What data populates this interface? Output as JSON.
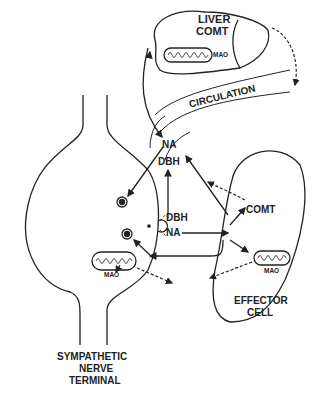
{
  "diagram": {
    "type": "pharmacology-schematic",
    "labels": {
      "liver": "LIVER",
      "liver_comt": "COMT",
      "liver_mao": "MAO",
      "circulation": "CIRCULATION",
      "na_top": "NA",
      "dbh_top": "DBH",
      "dbh_mid": "DBH",
      "na_mid": "NA",
      "comt_effector": "COMT",
      "mao_effector": "MAO",
      "mao_nerve": "MAO",
      "effector_1": "EFFECTOR",
      "effector_2": "CELL",
      "nerve_1": "SYMPATHETIC",
      "nerve_2": "NERVE",
      "nerve_3": "TERMINAL"
    },
    "colors": {
      "ink": "#222222",
      "background": "#ffffff"
    }
  }
}
